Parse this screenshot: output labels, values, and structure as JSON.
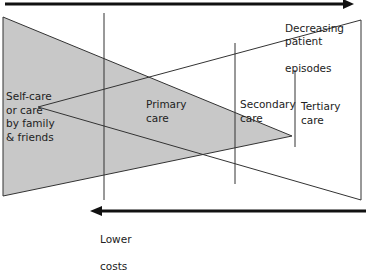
{
  "diagram": {
    "top_arrow": {
      "label_line1": "Decreasing patient",
      "label_line2": "episodes",
      "direction": "right"
    },
    "bottom_arrow": {
      "label_line1": "Lower",
      "label_line2": "costs",
      "direction": "left"
    },
    "levels": [
      {
        "id": "self-care",
        "label": "Self-care\nor care\nby family\n& friends"
      },
      {
        "id": "primary",
        "label": "Primary\ncare"
      },
      {
        "id": "secondary",
        "label": "Secondary\ncare"
      },
      {
        "id": "tertiary",
        "label": "Tertiary\ncare"
      }
    ],
    "colors": {
      "shaded_triangle": "#c8c8c8",
      "lines": "#2a2a2a",
      "arrow": "#111111",
      "background": "#ffffff"
    }
  }
}
